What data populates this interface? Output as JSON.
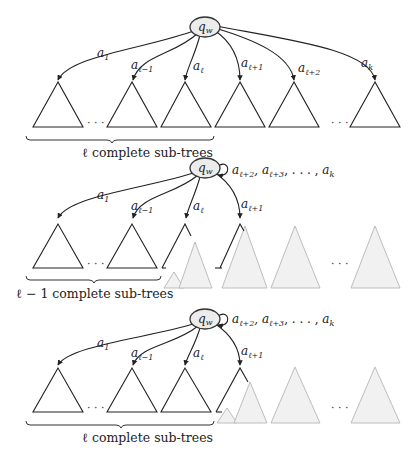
{
  "header_fragment": "...",
  "node_label": "q",
  "node_sub": "w",
  "diagrams": [
    {
      "id": "full",
      "edge_labels": [
        {
          "base": "a",
          "sub": "1"
        },
        {
          "base": "a",
          "sub": "ℓ−1"
        },
        {
          "base": "a",
          "sub": "ℓ"
        },
        {
          "base": "a",
          "sub": "ℓ+1"
        },
        {
          "base": "a",
          "sub": "ℓ+2"
        },
        {
          "base": "a",
          "sub": "k"
        }
      ],
      "dots": [
        "· · ·",
        "· · ·"
      ],
      "caption": "ℓ complete sub-trees"
    },
    {
      "id": "partial-1",
      "loop_label": {
        "items": [
          {
            "base": "a",
            "sub": "ℓ+2"
          },
          {
            "base": "a",
            "sub": "ℓ+3"
          }
        ],
        "ellipsis": ", . . . , ",
        "last": {
          "base": "a",
          "sub": "k"
        }
      },
      "edge_labels": [
        {
          "base": "a",
          "sub": "1"
        },
        {
          "base": "a",
          "sub": "ℓ−1"
        },
        {
          "base": "a",
          "sub": "ℓ"
        },
        {
          "base": "a",
          "sub": "ℓ+1"
        }
      ],
      "dots": [
        "· · ·",
        "· · ·"
      ],
      "caption": "ℓ − 1 complete sub-trees"
    },
    {
      "id": "partial-2",
      "loop_label": {
        "items": [
          {
            "base": "a",
            "sub": "ℓ+2"
          },
          {
            "base": "a",
            "sub": "ℓ+3"
          }
        ],
        "ellipsis": ", . . . , ",
        "last": {
          "base": "a",
          "sub": "k"
        }
      },
      "edge_labels": [
        {
          "base": "a",
          "sub": "1"
        },
        {
          "base": "a",
          "sub": "ℓ−1"
        },
        {
          "base": "a",
          "sub": "ℓ"
        },
        {
          "base": "a",
          "sub": "ℓ+1"
        }
      ],
      "dots": [
        "· · ·",
        "· · ·"
      ],
      "caption": "ℓ complete sub-trees"
    }
  ],
  "colors": {
    "stroke": "#222222",
    "node_fill": "#ececec",
    "ghost_fill": "#f1f1f1",
    "ghost_stroke": "#bdbdbd"
  }
}
